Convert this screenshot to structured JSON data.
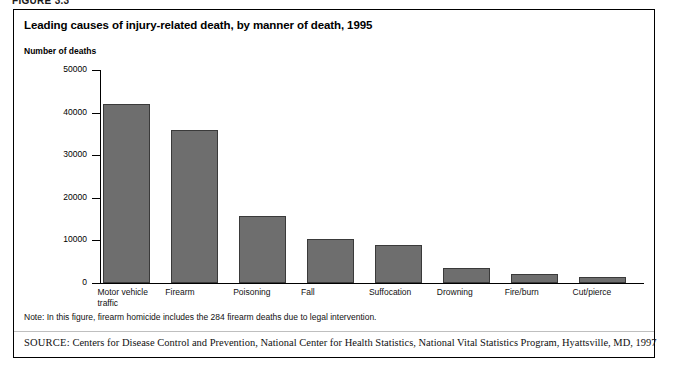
{
  "figure": {
    "number_label": "FIGURE 3.3",
    "title": "Leading causes of injury-related death, by manner of death, 1995",
    "note": "Note: In this figure, firearm homicide includes the 284 firearm deaths due to legal intervention.",
    "source_label": "SOURCE:",
    "source_text": "Centers for Disease Control and Prevention, National Center for Health Statistics, National Vital Statistics Program, Hyattsville, MD, 1997"
  },
  "style": {
    "bar_fill": "#6e6e6e",
    "bar_border": "#3a3a3a",
    "axis_color": "#000000",
    "frame_color": "#000000",
    "background": "#ffffff"
  },
  "chart_data": {
    "type": "bar",
    "title": "Leading causes of injury-related death, by manner of death, 1995",
    "xlabel": "",
    "ylabel": "Number of deaths",
    "ylim": [
      0,
      50000
    ],
    "yticks": [
      0,
      10000,
      20000,
      30000,
      40000,
      50000
    ],
    "ytick_labels": [
      "0",
      "10000",
      "20000",
      "30000",
      "40000",
      "50000"
    ],
    "grid": false,
    "legend": false,
    "categories": [
      "Motor vehicle\ntraffic",
      "Firearm",
      "Poisoning",
      "Fall",
      "Suffocation",
      "Drowning",
      "Fire/burn",
      "Cut/pierce"
    ],
    "values": [
      42000,
      36000,
      15700,
      10300,
      9000,
      3500,
      2200,
      1300
    ]
  }
}
